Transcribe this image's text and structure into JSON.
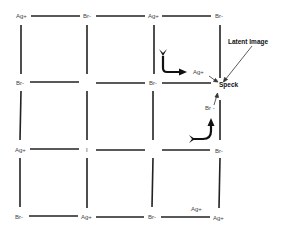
{
  "colors": {
    "line": "#222222",
    "text": "#444444",
    "background": "#ffffff"
  },
  "grid": {
    "rows": [
      [
        "Ag+",
        "Br-",
        "Ag+",
        "Br-"
      ],
      [
        "Br-",
        "",
        "Br-",
        ""
      ],
      [
        "Ag+",
        "I",
        "",
        "Br-"
      ],
      [
        "Br-",
        "Ag+",
        "Br-",
        "Ag+"
      ]
    ]
  },
  "labels": {
    "r0c0": "Ag+",
    "r0c1": "Br-",
    "r0c2": "Ag+",
    "r0c3": "Br-",
    "r1c0": "Br-",
    "r1c2": "Br-",
    "r2c0": "Ag+",
    "r2c1": "I",
    "r2c3": "Br-",
    "r3c0": "Br-",
    "r3c1": "Ag+",
    "r3c2": "Br-",
    "r3c3": "Ag+",
    "ag_interstitial_top": "Ag+",
    "br_near_speck": "Br -",
    "ag_bottom_extra": "Ag+",
    "speck": "Speck",
    "latent_image": "Latent Image"
  },
  "arrows": [
    {
      "name": "ag-migration-arrow",
      "description": "curved arrow pointing right toward Ag+"
    },
    {
      "name": "br-migration-arrow",
      "description": "curved arrow pointing up toward Br-"
    },
    {
      "name": "ag-to-speck-arrow",
      "description": "small arrow from Ag+ to Speck"
    },
    {
      "name": "br-to-speck-arrow",
      "description": "small arrow from Br- to Speck"
    },
    {
      "name": "latent-image-pointer",
      "description": "line from Latent Image label to Speck"
    }
  ]
}
